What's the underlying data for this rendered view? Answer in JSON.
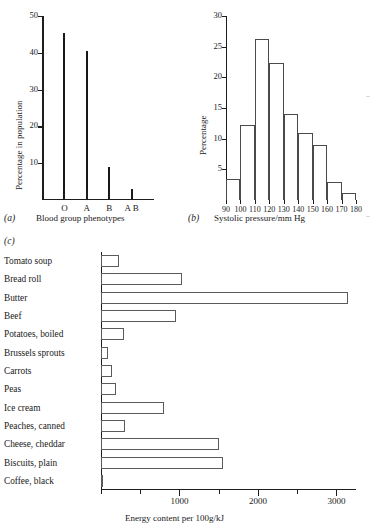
{
  "figure": {
    "panels": [
      "(a)",
      "(b)",
      "(c)"
    ]
  },
  "chart_data": [
    {
      "type": "bar",
      "panel": "(a)",
      "title": "",
      "xlabel": "Blood group phenotypes",
      "ylabel": "Percentage in population",
      "categories": [
        "O",
        "A",
        "B",
        "A B"
      ],
      "values": [
        45.5,
        40.5,
        9.0,
        3.0
      ],
      "ylim": [
        0,
        50
      ],
      "yticks": [
        0,
        10,
        20,
        30,
        40,
        50
      ],
      "yticklabels": [
        "",
        "10",
        "20",
        "30",
        "40",
        "50"
      ],
      "grid": false,
      "legend": "none",
      "style": "thin vertical spikes"
    },
    {
      "type": "bar",
      "panel": "(b)",
      "title": "",
      "xlabel": "Systolic pressure/mm Hg",
      "ylabel": "Percentage",
      "categories": [
        "90-100",
        "100-110",
        "110-120",
        "120-130",
        "130-140",
        "140-150",
        "150-160",
        "160-170",
        "170-180"
      ],
      "bin_edges": [
        90,
        100,
        110,
        120,
        130,
        140,
        150,
        160,
        170,
        180
      ],
      "xticklabels": [
        "90",
        "100",
        "110",
        "120",
        "130",
        "140",
        "150",
        "160",
        "170",
        "180"
      ],
      "values": [
        3.4,
        12.2,
        26.3,
        22.4,
        14.0,
        11.0,
        9.0,
        2.9,
        1.2
      ],
      "ylim": [
        0,
        30
      ],
      "yticks": [
        5,
        10,
        15,
        20,
        25,
        30
      ],
      "yticklabels": [
        "5",
        "10",
        "15",
        "20",
        "25",
        "30"
      ],
      "grid": false,
      "legend": "none",
      "style": "histogram, unfilled outlined bars"
    },
    {
      "type": "bar",
      "panel": "(c)",
      "orientation": "horizontal",
      "title": "",
      "xlabel": "Energy content per 100g/kJ",
      "ylabel": "",
      "categories": [
        "Tomato soup",
        "Bread roll",
        "Butter",
        "Beef",
        "Potatoes, boiled",
        "Brussels sprouts",
        "Carrots",
        "Peas",
        "Ice cream",
        "Peaches, canned",
        "Cheese, cheddar",
        "Biscuits, plain",
        "Coffee, black"
      ],
      "values": [
        230,
        1030,
        3150,
        960,
        290,
        90,
        140,
        190,
        800,
        300,
        1500,
        1560,
        10
      ],
      "xlim": [
        0,
        3250
      ],
      "xticks": [
        0,
        500,
        1000,
        1500,
        2000,
        2500,
        3000
      ],
      "xticklabels": [
        "",
        "",
        "1000",
        "",
        "2000",
        "",
        "3000"
      ],
      "grid": false,
      "legend": "none",
      "style": "unfilled outlined horizontal bars"
    }
  ]
}
